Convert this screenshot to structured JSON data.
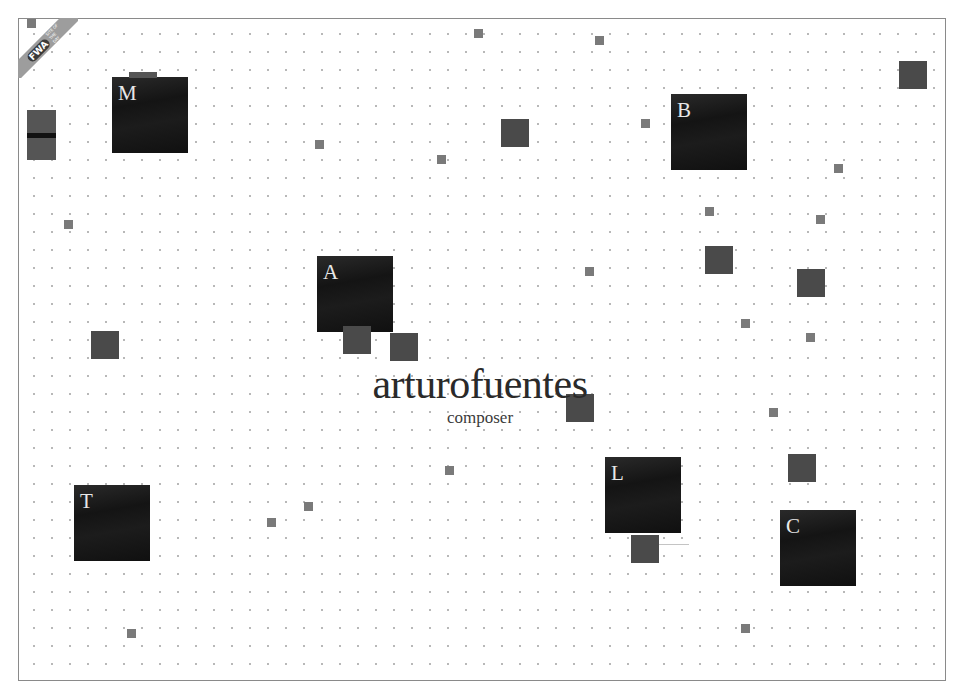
{
  "site": {
    "title": "arturofuentes",
    "subtitle": "composer"
  },
  "badge": {
    "logo": "FWA",
    "text": "SITE OF THE DAY"
  },
  "nav_squares": [
    {
      "letter": "M",
      "x": 111,
      "y": 76
    },
    {
      "letter": "B",
      "x": 670,
      "y": 93
    },
    {
      "letter": "A",
      "x": 316,
      "y": 255
    },
    {
      "letter": "T",
      "x": 73,
      "y": 484
    },
    {
      "letter": "L",
      "x": 604,
      "y": 456
    },
    {
      "letter": "C",
      "x": 779,
      "y": 509
    }
  ],
  "colors": {
    "background": "#ffffff",
    "frame_border": "#8a8a8a",
    "big_square": "#151515",
    "mid_square": "#4a4a4a",
    "small_square": "#7a7a7a",
    "dots": "#b8b8b8",
    "title_text": "#2a2a2a",
    "letter_text": "#e8e8e8"
  }
}
